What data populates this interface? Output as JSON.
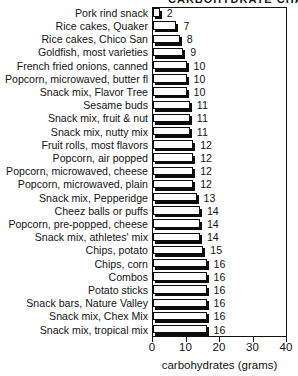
{
  "title_partial": "CARBOHYDRATE CHART",
  "chart_data": {
    "type": "bar",
    "orientation": "horizontal",
    "title": "CARBOHYDRATE CHART",
    "xlabel": "carbohydrates (grams)",
    "ylabel": "",
    "xlim": [
      0,
      40
    ],
    "xticks": [
      0,
      10,
      20,
      30,
      40
    ],
    "xtick_labels": [
      "0",
      "10",
      "20",
      "30",
      "40"
    ],
    "grid": false,
    "legend": false,
    "bar_style": "white fill, black outline, black drop shadow",
    "categories": [
      "Pork rind snack",
      "Rice cakes, Quaker",
      "Rice cakes, Chico San",
      "Goldfish, most varieties",
      "French fried onions, canned",
      "Popcorn, microwaved, butter fl",
      "Snack mix, Flavor Tree",
      "Sesame buds",
      "Snack mix, fruit & nut",
      "Snack mix, nutty mix",
      "Fruit rolls, most flavors",
      "Popcorn, air popped",
      "Popcorn, microwaved, cheese",
      "Popcorn, microwaved, plain",
      "Snack mix, Pepperidge",
      "Cheez balls or puffs",
      "Popcorn, pre-popped, cheese",
      "Snack mix, athletes' mix",
      "Chips, potato",
      "Chips, corn",
      "Combos",
      "Potato sticks",
      "Snack bars, Nature Valley",
      "Snack mix, Chex Mix",
      "Snack mix, tropical mix"
    ],
    "values": [
      2,
      7,
      8,
      9,
      10,
      10,
      10,
      11,
      11,
      11,
      12,
      12,
      12,
      12,
      13,
      14,
      14,
      14,
      15,
      16,
      16,
      16,
      16,
      16,
      16
    ],
    "value_labels": [
      "2",
      "7",
      "8",
      "9",
      "10",
      "10",
      "10",
      "11",
      "11",
      "11",
      "12",
      "12",
      "12",
      "12",
      "13",
      "14",
      "14",
      "14",
      "15",
      "16",
      "16",
      "16",
      "16",
      "16",
      "16"
    ],
    "units": "grams"
  }
}
